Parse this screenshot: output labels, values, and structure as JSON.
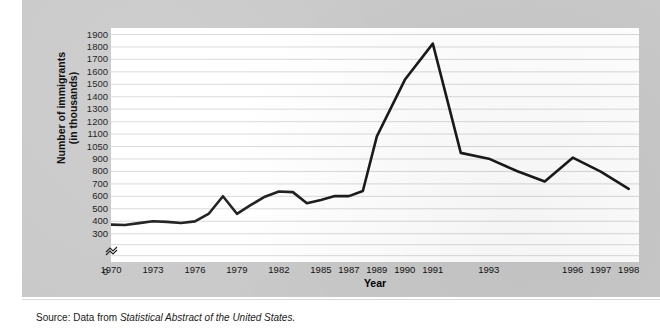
{
  "figure": {
    "source_prefix": "Source: Data from ",
    "source_title": "Statistical Abstract of the United States.",
    "y_axis_title_line1": "Number of immigrants",
    "y_axis_title_line2": "(in thousands)",
    "x_axis_title": "Year",
    "axis_break_symbol": "break-mark",
    "line_color": "#1a1a1a",
    "grid_color": "#d5d5d5",
    "plot_background": "#ffffff",
    "panel_background": "#c9c9c9"
  },
  "chart_data": {
    "type": "line",
    "title": "",
    "xlabel": "Year",
    "ylabel": "Number of immigrants (in thousands)",
    "grid": true,
    "legend": "none",
    "axis_break": {
      "axis": "y",
      "between": [
        0,
        300
      ],
      "note": "y-axis is broken below 300 and compressed above 900"
    },
    "ytick_labels": [
      "1900",
      "1800",
      "1700",
      "1600",
      "1500",
      "1400",
      "1300",
      "1200",
      "1100",
      "1050",
      "900",
      "800",
      "700",
      "600",
      "500",
      "400",
      "300",
      "0"
    ],
    "ylim": [
      300,
      1900
    ],
    "xtick_labels": [
      "1970",
      "1973",
      "1976",
      "1979",
      "1982",
      "1985",
      "1987",
      "1989",
      "1990",
      "1991",
      "1993",
      "1996",
      "1997",
      "1998"
    ],
    "xlim": [
      1970,
      1998
    ],
    "x": [
      1970,
      1971,
      1972,
      1973,
      1974,
      1975,
      1976,
      1977,
      1978,
      1979,
      1980,
      1981,
      1982,
      1983,
      1984,
      1985,
      1986,
      1987,
      1988,
      1989,
      1990,
      1991,
      1992,
      1993,
      1994,
      1995,
      1996,
      1997,
      1998
    ],
    "values": [
      373,
      370,
      385,
      400,
      395,
      386,
      399,
      462,
      601,
      460,
      531,
      597,
      639,
      634,
      544,
      570,
      602,
      602,
      643,
      1091,
      1536,
      1827,
      974,
      904,
      804,
      720,
      916,
      798,
      660
    ],
    "series": [
      {
        "name": "Number of immigrants (in thousands)",
        "values": [
          373,
          370,
          385,
          400,
          395,
          386,
          399,
          462,
          601,
          460,
          531,
          597,
          639,
          634,
          544,
          570,
          602,
          602,
          643,
          1091,
          1536,
          1827,
          974,
          904,
          804,
          720,
          916,
          798,
          660
        ]
      }
    ]
  }
}
